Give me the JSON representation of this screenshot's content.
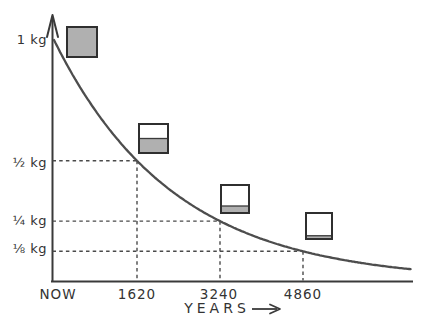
{
  "figure": {
    "background": "#ffffff",
    "ink": "#3a3a3a",
    "curve_color": "#4d4d4d",
    "guide_color": "#4a4a4a",
    "box_fill": "#b0b0b0",
    "box_empty": "#ffffff",
    "box_border": "#2f2f2f"
  },
  "chart_data": {
    "type": "line",
    "title": "",
    "xlabel": "YEARS",
    "ylabel": "",
    "x_tick_labels": [
      "NOW",
      "1620",
      "3240",
      "4860"
    ],
    "x_tick_years": [
      0,
      1620,
      3240,
      4860
    ],
    "y_tick_labels": [
      "1 kg",
      "½ kg",
      "¼ kg",
      "⅛ kg"
    ],
    "y_tick_values": [
      1,
      0.5,
      0.25,
      0.125
    ],
    "half_life_years": 1620,
    "initial_mass_kg": 1,
    "x_range_years": [
      0,
      7000
    ],
    "y_range_kg": [
      0,
      1
    ],
    "grid": false,
    "legend": "none",
    "curve_shape": "exponential-decay",
    "series": [
      {
        "name": "mass remaining (kg)",
        "x": [
          0,
          1620,
          3240,
          4860,
          6480
        ],
        "values": [
          1,
          0.5,
          0.25,
          0.125,
          0.0625
        ]
      }
    ],
    "guides": [
      {
        "years": 1620,
        "kg": 0.5
      },
      {
        "years": 3240,
        "kg": 0.25
      },
      {
        "years": 4860,
        "kg": 0.125
      }
    ],
    "boxes": [
      {
        "fraction_full": 1.0
      },
      {
        "fraction_full": 0.5
      },
      {
        "fraction_full": 0.25
      },
      {
        "fraction_full": 0.125
      }
    ]
  }
}
